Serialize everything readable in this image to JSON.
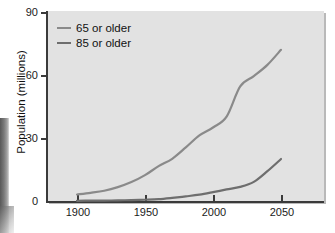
{
  "chart_data": {
    "type": "line",
    "title": "",
    "subtitle": "",
    "xlabel": "",
    "ylabel": "Population (millions)",
    "xlim": [
      1880,
      2060
    ],
    "ylim": [
      0,
      90
    ],
    "grid": false,
    "legend_position": "upper left",
    "xticks": [
      1900,
      1950,
      2000,
      2050
    ],
    "xtick_labels": [
      "1900",
      "1950",
      "2000",
      "2050"
    ],
    "yticks": [
      0,
      30,
      60,
      90
    ],
    "ytick_labels": [
      "0",
      "30",
      "60",
      "90"
    ],
    "series": [
      {
        "name": "65 or older",
        "color": "#8a8a8a",
        "x": [
          1900,
          1910,
          1920,
          1930,
          1940,
          1950,
          1960,
          1970,
          1980,
          1990,
          2000,
          2010,
          2020,
          2030,
          2040,
          2050
        ],
        "values": [
          3.1,
          3.9,
          4.9,
          6.6,
          9.0,
          12.3,
          16.6,
          20.1,
          25.5,
          31.2,
          35.0,
          40.2,
          54.6,
          71.5,
          80.0,
          72.0
        ]
      },
      {
        "name": "85 or older",
        "color": "#6e6e6e",
        "x": [
          1900,
          1910,
          1920,
          1930,
          1940,
          1950,
          1960,
          1970,
          1980,
          1990,
          2000,
          2010,
          2020,
          2030,
          2040,
          2050
        ],
        "values": [
          0.1,
          0.2,
          0.2,
          0.3,
          0.4,
          0.6,
          0.9,
          1.5,
          2.2,
          3.0,
          4.2,
          5.5,
          6.7,
          9.1,
          14.2,
          20.0
        ]
      }
    ],
    "annotations": []
  },
  "axis": {
    "y_title": "Population (millions)",
    "y_ticks": [
      "90",
      "60",
      "30",
      "0"
    ],
    "x_ticks": [
      "1900",
      "1950",
      "2000",
      "2050"
    ]
  },
  "legend": {
    "items": [
      {
        "label": "65 or older",
        "color": "#8a8a8a"
      },
      {
        "label": "85 or older",
        "color": "#6e6e6e"
      }
    ]
  },
  "colors": {
    "plot_background": "#e2e2e2",
    "page_background": "#ffffff",
    "axis": "#3a3a3a",
    "text": "#111111",
    "series_65": "#8a8a8a",
    "series_85": "#6e6e6e"
  }
}
